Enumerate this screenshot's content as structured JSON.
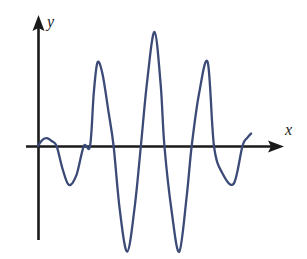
{
  "figure": {
    "title": "",
    "background_color": "#ffffff",
    "width": 307,
    "height": 259
  },
  "axes": {
    "x_axis": {
      "label": "x",
      "color": "#1a1a1a",
      "arrow": "arrow-right",
      "origin_y": 146,
      "start_x": 26,
      "end_x": 284
    },
    "y_axis": {
      "label": "y",
      "color": "#1a1a1a",
      "arrow": "arrow-up",
      "origin_x": 38,
      "start_y": 240,
      "end_y": 18
    }
  },
  "chart_data": {
    "type": "line",
    "title": "",
    "xlabel": "x",
    "ylabel": "y",
    "grid": false,
    "legend": null,
    "series_color": "#3b4a77",
    "line_width": 2,
    "xlim": [
      0,
      9.4
    ],
    "ylim": [
      -3.9,
      4.2
    ],
    "axis_crossings_x": [
      0.0,
      0.75,
      2.1,
      3.05,
      4.15,
      5.1,
      6.2,
      7.1,
      8.25,
      8.55
    ],
    "extrema": [
      {
        "kind": "peak",
        "x": 0.36,
        "y": 0.28
      },
      {
        "kind": "trough",
        "x": 1.25,
        "y": -1.4
      },
      {
        "kind": "peak",
        "x": 2.4,
        "y": 3.0
      },
      {
        "kind": "trough",
        "x": 3.6,
        "y": -3.8
      },
      {
        "kind": "peak",
        "x": 4.7,
        "y": 4.1
      },
      {
        "kind": "trough",
        "x": 5.7,
        "y": -3.8
      },
      {
        "kind": "peak",
        "x": 6.85,
        "y": 3.0
      },
      {
        "kind": "trough",
        "x": 7.9,
        "y": -1.35
      },
      {
        "kind": "peak",
        "x": 8.6,
        "y": 0.45
      }
    ],
    "x": [
      0.0,
      0.18,
      0.36,
      0.55,
      0.75,
      1.0,
      1.25,
      1.55,
      1.85,
      2.1,
      2.25,
      2.4,
      2.6,
      2.85,
      3.05,
      3.3,
      3.6,
      3.9,
      4.15,
      4.4,
      4.7,
      4.95,
      5.1,
      5.4,
      5.7,
      6.0,
      6.2,
      6.5,
      6.85,
      7.1,
      7.45,
      7.9,
      8.25,
      8.45,
      8.6
    ],
    "y": [
      0.0,
      0.22,
      0.28,
      0.18,
      0.0,
      -0.85,
      -1.4,
      -1.05,
      0.0,
      0.0,
      1.9,
      3.0,
      2.6,
      1.2,
      0.0,
      -2.3,
      -3.8,
      -2.2,
      0.0,
      2.3,
      4.1,
      2.2,
      0.0,
      -2.4,
      -3.8,
      -1.8,
      0.0,
      1.9,
      3.0,
      0.0,
      -1.0,
      -1.35,
      0.0,
      0.3,
      0.45
    ]
  },
  "icons": {
    "x_arrow": "arrow-right-icon",
    "y_arrow": "arrow-up-icon"
  }
}
